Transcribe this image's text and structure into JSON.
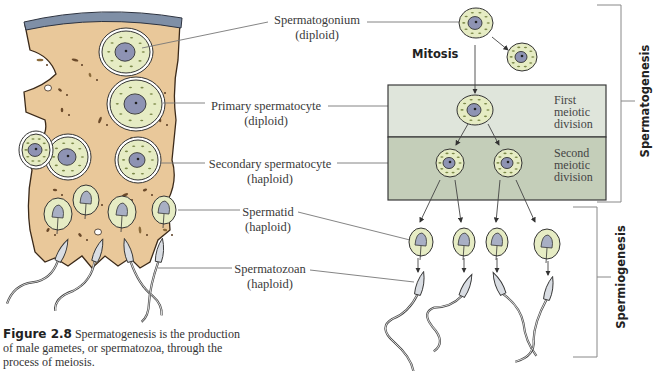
{
  "labels": {
    "spermatogonium": {
      "name": "Spermatogonium",
      "ploidy": "(diploid)"
    },
    "primary_spermatocyte": {
      "name": "Primary spermatocyte",
      "ploidy": "(diploid)"
    },
    "secondary_spermatocyte": {
      "name": "Secondary spermatocyte",
      "ploidy": "(haploid)"
    },
    "spermatid": {
      "name": "Spermatid",
      "ploidy": "(haploid)"
    },
    "spermatozoan": {
      "name": "Spermatozoan",
      "ploidy": "(haploid)"
    }
  },
  "stages": {
    "mitosis": "Mitosis",
    "first_meiotic": [
      "First",
      "meiotic",
      "division"
    ],
    "second_meiotic": [
      "Second",
      "meiotic",
      "division"
    ]
  },
  "brackets": {
    "spermatogenesis": "Spermatogenesis",
    "spermiogenesis": "Spermiogenesis"
  },
  "caption": {
    "figure_number": "Figure 2.8",
    "text": "Spermatogenesis is the production of male gametes, or spermatozoa, through the process of meiosis."
  },
  "colors": {
    "tissue": "#e9c89a",
    "tissue_edge": "#3b2a1a",
    "basement": "#7f8fa6",
    "cytoplasm": "#e6ecc4",
    "nucleus": "#8e93b3",
    "box_first": "#dfe5db",
    "box_second": "#c4ceb9",
    "sperm_head": "#d9dde3"
  }
}
